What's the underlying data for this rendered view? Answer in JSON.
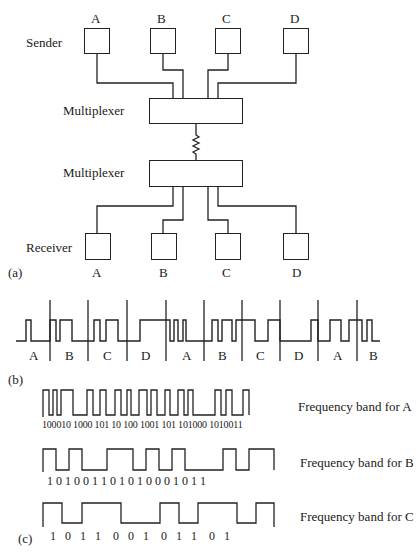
{
  "panel_a": {
    "sender_label": "Sender",
    "receiver_label": "Receiver",
    "mux_top_label": "Multiplexer",
    "mux_bottom_label": "Multiplexer",
    "caption": "(a)",
    "sender_channels": [
      "A",
      "B",
      "C",
      "D"
    ],
    "receiver_channels": [
      "A",
      "B",
      "C",
      "D"
    ]
  },
  "panel_b": {
    "caption": "(b)",
    "slots": [
      "A",
      "B",
      "C",
      "D",
      "A",
      "B",
      "C",
      "D",
      "A",
      "B"
    ]
  },
  "panel_c": {
    "caption": "(c)",
    "bands": [
      {
        "label": "Frequency band for A",
        "bits": "100010 1000 101 10 100 1001 101 101000 1010011"
      },
      {
        "label": "Frequency band for B",
        "bits": "1 0 1 0 0 1 1 0 1 0 1 0 0 0 1 0 1 1"
      },
      {
        "label": "Frequency band for C",
        "bits": "1   0   1   1    0   0   1    0   1   1    0   1"
      }
    ]
  }
}
